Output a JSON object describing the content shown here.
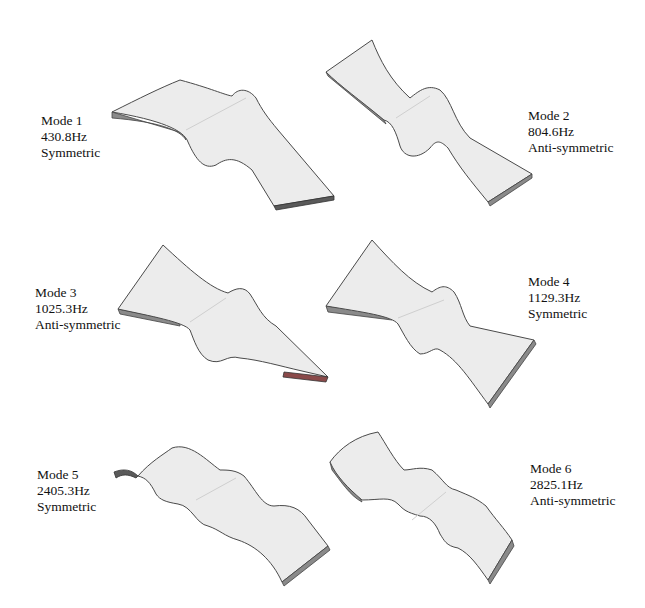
{
  "figure": {
    "modes": [
      {
        "id": "mode-1",
        "name": "Mode 1",
        "frequency": "430.8Hz",
        "symmetry": "Symmetric"
      },
      {
        "id": "mode-2",
        "name": "Mode 2",
        "frequency": "804.6Hz",
        "symmetry": "Anti-symmetric"
      },
      {
        "id": "mode-3",
        "name": "Mode 3",
        "frequency": "1025.3Hz",
        "symmetry": "Anti-symmetric"
      },
      {
        "id": "mode-4",
        "name": "Mode 4",
        "frequency": "1129.3Hz",
        "symmetry": "Symmetric"
      },
      {
        "id": "mode-5",
        "name": "Mode 5",
        "frequency": "2405.3Hz",
        "symmetry": "Symmetric"
      },
      {
        "id": "mode-6",
        "name": "Mode 6",
        "frequency": "2825.1Hz",
        "symmetry": "Anti-symmetric"
      }
    ]
  }
}
